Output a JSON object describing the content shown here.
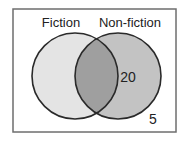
{
  "diagram": {
    "type": "venn",
    "frame": {
      "x": 13,
      "y": 9,
      "width": 163,
      "height": 123,
      "stroke": "#6e6e6e",
      "fill": "#ffffff"
    },
    "sets": [
      {
        "name": "Fiction",
        "label": "Fiction",
        "cx": 75,
        "cy": 76,
        "r": 43,
        "fill_only": "#e4e4e4",
        "label_x": 61,
        "label_y": 27
      },
      {
        "name": "Non-fiction",
        "label": "Non-fiction",
        "cx": 118,
        "cy": 76,
        "r": 43,
        "fill_only": "#c3c3c3",
        "label_x": 130,
        "label_y": 27
      }
    ],
    "intersection_fill": "#9f9f9f",
    "outline_color": "#2a2a2a",
    "values": {
      "nonfiction_only": {
        "text": "20",
        "x": 128,
        "y": 82
      },
      "outside": {
        "text": "5",
        "x": 153,
        "y": 124
      }
    }
  }
}
